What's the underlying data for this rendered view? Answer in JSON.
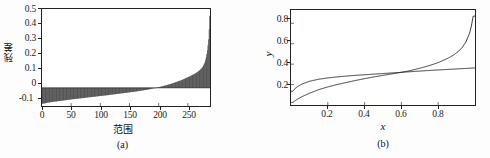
{
  "figure": {
    "background": "#fdfdfd",
    "axis_color": "#222222",
    "line_color": "#1a1a1a"
  },
  "panel_a": {
    "caption": "(a)",
    "xlabel": "范围",
    "ylabel": "残差",
    "xticks": [
      "0",
      "50",
      "100",
      "150",
      "200",
      "250"
    ],
    "yticks": [
      "0.5",
      "0.4",
      "0.3",
      "0.2",
      "0.1",
      "0",
      "-0.1"
    ]
  },
  "panel_b": {
    "caption": "(b)",
    "xlabel": "x",
    "ylabel": "y",
    "xticks": [
      "0.2",
      "0.4",
      "0.6",
      "0.8"
    ],
    "yticks": [
      "0.8",
      "0.6",
      "0.4",
      "0.2"
    ]
  },
  "chart_data": [
    {
      "type": "bar",
      "panel": "(a)",
      "title": "",
      "xlabel": "范围",
      "ylabel": "残差",
      "xlim": [
        0,
        288
      ],
      "ylim": [
        -0.12,
        0.52
      ],
      "xticks": [
        0,
        50,
        100,
        150,
        200,
        250
      ],
      "yticks": [
        -0.1,
        0,
        0.1,
        0.2,
        0.3,
        0.4,
        0.5
      ],
      "grid": false,
      "legend": false,
      "description": "Sorted residuals: dense vertical bars from a negative baseline near -0.1 rising monotonically through zero near index 190 and spiking to about 0.52 at the right edge.",
      "x": [
        2,
        10,
        20,
        30,
        40,
        50,
        60,
        70,
        80,
        90,
        100,
        110,
        120,
        130,
        140,
        150,
        160,
        170,
        180,
        190,
        200,
        210,
        220,
        230,
        240,
        250,
        258,
        265,
        270,
        275,
        279,
        282,
        284,
        286,
        287,
        288
      ],
      "values": [
        -0.105,
        -0.098,
        -0.092,
        -0.087,
        -0.082,
        -0.077,
        -0.072,
        -0.068,
        -0.063,
        -0.059,
        -0.054,
        -0.05,
        -0.045,
        -0.04,
        -0.035,
        -0.03,
        -0.025,
        -0.019,
        -0.013,
        -0.005,
        0.004,
        0.014,
        0.025,
        0.038,
        0.052,
        0.07,
        0.085,
        0.1,
        0.115,
        0.135,
        0.165,
        0.21,
        0.26,
        0.34,
        0.43,
        0.52
      ]
    },
    {
      "type": "line",
      "panel": "(b)",
      "title": "",
      "xlabel": "x",
      "ylabel": "y",
      "xlim": [
        0,
        1.0
      ],
      "ylim": [
        0,
        0.93
      ],
      "xticks": [
        0.2,
        0.4,
        0.6,
        0.8
      ],
      "yticks": [
        0.2,
        0.4,
        0.6,
        0.8
      ],
      "grid": false,
      "legend": false,
      "description": "Two monotonically increasing unlabeled curves crossing near x=0.63, y=0.33. Curve 1 saturates to about 0.36; curve 2 is S-shaped and rises steeply near x=1 to about 0.87.",
      "x": [
        0.01,
        0.03,
        0.06,
        0.1,
        0.15,
        0.2,
        0.25,
        0.3,
        0.35,
        0.4,
        0.45,
        0.5,
        0.55,
        0.6,
        0.63,
        0.65,
        0.7,
        0.75,
        0.8,
        0.85,
        0.88,
        0.91,
        0.93,
        0.95,
        0.97,
        0.98,
        0.99
      ],
      "series": [
        {
          "name": "curve-1",
          "values": [
            0.135,
            0.175,
            0.205,
            0.232,
            0.252,
            0.265,
            0.275,
            0.283,
            0.29,
            0.296,
            0.302,
            0.308,
            0.314,
            0.32,
            0.324,
            0.326,
            0.332,
            0.338,
            0.343,
            0.348,
            0.351,
            0.354,
            0.356,
            0.358,
            0.36,
            0.361,
            0.362
          ]
        },
        {
          "name": "curve-2",
          "values": [
            0.025,
            0.052,
            0.082,
            0.115,
            0.15,
            0.177,
            0.2,
            0.22,
            0.24,
            0.258,
            0.275,
            0.29,
            0.305,
            0.32,
            0.33,
            0.337,
            0.36,
            0.385,
            0.415,
            0.455,
            0.485,
            0.525,
            0.562,
            0.615,
            0.7,
            0.77,
            0.87
          ]
        }
      ]
    }
  ]
}
